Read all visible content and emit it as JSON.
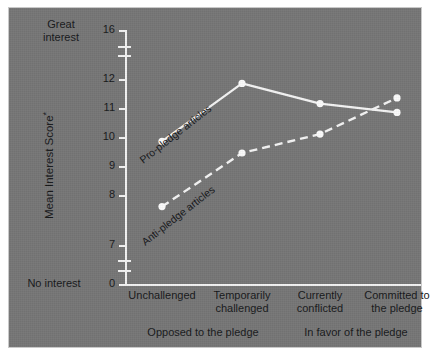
{
  "figure": {
    "background_color": "#767676",
    "ink_color": "#f2f2f2",
    "text_color": "#17181a"
  },
  "axes": {
    "y_title": "Mean Interest Score",
    "y_title_superscript": "*",
    "y_top_label": "Great\ninterest",
    "y_top_label_line1": "Great",
    "y_top_label_line2": "interest",
    "y_bottom_label": "No interest",
    "y_ticks": [
      "16",
      "12",
      "11",
      "10",
      "9",
      "8",
      "7",
      "0"
    ],
    "y_breaks": 2,
    "x_group_left": "Opposed to the pledge",
    "x_group_right": "In favor of the pledge"
  },
  "chart_data": {
    "type": "line",
    "title": "",
    "xlabel": "",
    "ylabel": "Mean Interest Score*",
    "ylim": [
      7,
      12
    ],
    "yticks": [
      7,
      8,
      9,
      10,
      11,
      12,
      16
    ],
    "axis_breaks": [
      [
        0,
        7
      ],
      [
        12,
        16
      ]
    ],
    "grid": false,
    "legend": "inline-labels",
    "categories": [
      "Unchallenged",
      "Temporarily challenged",
      "Currently conflicted",
      "Committed to the pledge"
    ],
    "categories_wrapped": [
      [
        "Unchallenged",
        ""
      ],
      [
        "Temporarily",
        "challenged"
      ],
      [
        "Currently",
        "conflicted"
      ],
      [
        "Committed to",
        "the pledge"
      ]
    ],
    "series": [
      {
        "name": "Pro-pledge articles",
        "style": "solid",
        "marker": "circle",
        "values": [
          9.85,
          11.85,
          11.15,
          10.85
        ]
      },
      {
        "name": "Anti-pledge articles",
        "style": "dashed",
        "marker": "circle",
        "values": [
          7.6,
          9.45,
          10.1,
          11.35
        ]
      }
    ],
    "annotations": [
      {
        "text": "Pro-pledge articles",
        "rotation": -38
      },
      {
        "text": "Anti-pledge articles",
        "rotation": -38
      }
    ]
  }
}
